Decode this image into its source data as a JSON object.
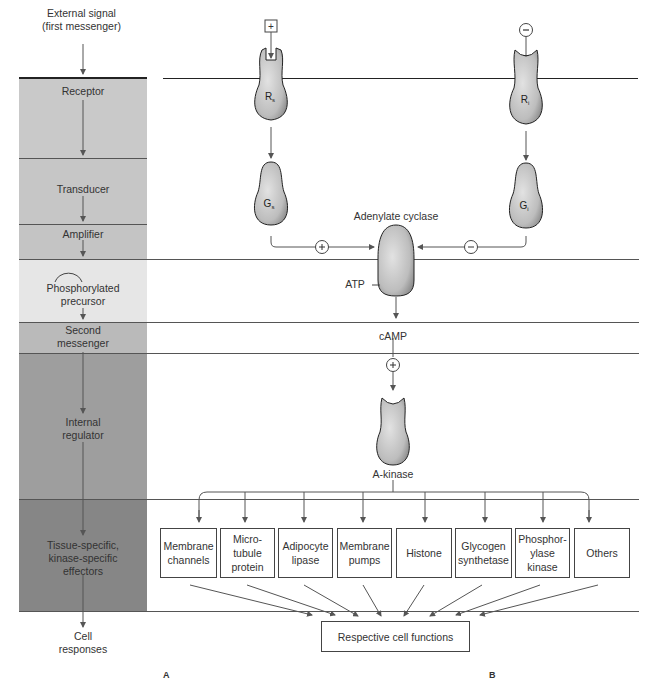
{
  "panel_a": {
    "top_label_line1": "External signal",
    "top_label_line2": "(first messenger)",
    "stages": [
      {
        "label": [
          "Receptor"
        ],
        "color": "#c9c9c9"
      },
      {
        "label": [
          "Transducer"
        ],
        "color": "#c6c6c6"
      },
      {
        "label": [
          "Amplifier"
        ],
        "color": "#c6c6c6"
      },
      {
        "label": [
          "Phosphorylated",
          "precursor"
        ],
        "color": "#e4e4e4"
      },
      {
        "label": [
          "Second",
          "messenger"
        ],
        "color": "#b9b9b9"
      },
      {
        "label": [
          "Internal",
          "regulator"
        ],
        "color": "#9d9d9d"
      },
      {
        "label": [
          "Tissue-specific,",
          "kinase-specific",
          "effectors"
        ],
        "color": "#858585"
      }
    ],
    "bottom_label_line1": "Cell",
    "bottom_label_line2": "responses",
    "panel_letter": "A"
  },
  "panel_b": {
    "stimulatory_signal": "+",
    "inhibitory_signal": "−",
    "receptor_s": "Rs",
    "receptor_i": "Ri",
    "g_s": "Gs",
    "g_i": "Gi",
    "adenylate_cyclase": "Adenylate cyclase",
    "stimulate_sign": "+",
    "inhibit_sign": "−",
    "atp": "ATP",
    "camp": "cAMP",
    "camp_sign": "+",
    "a_kinase": "A-kinase",
    "effectors": [
      [
        "Membrane",
        "channels"
      ],
      [
        "Micro-",
        "tubule",
        "protein"
      ],
      [
        "Adipocyte",
        "lipase"
      ],
      [
        "Membrane",
        "pumps"
      ],
      [
        "Histone"
      ],
      [
        "Glycogen",
        "synthetase"
      ],
      [
        "Phosphor-",
        "ylase",
        "kinase"
      ],
      [
        "Others"
      ]
    ],
    "result": "Respective cell functions",
    "panel_letter": "B"
  }
}
